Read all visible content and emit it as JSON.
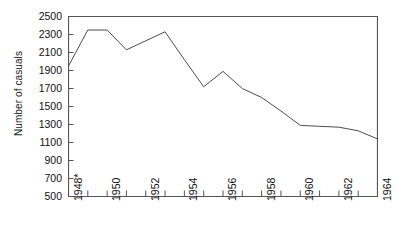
{
  "chart_data": {
    "type": "line",
    "title": "",
    "xlabel": "",
    "ylabel": "Number of casuals",
    "x": [
      1948,
      1949,
      1950,
      1951,
      1952,
      1953,
      1954,
      1955,
      1956,
      1957,
      1958,
      1959,
      1960,
      1961,
      1962,
      1963,
      1964
    ],
    "values": [
      1950,
      2350,
      2350,
      2130,
      2230,
      2330,
      2020,
      1720,
      1890,
      1700,
      1600,
      1450,
      1290,
      1280,
      1270,
      1230,
      1140
    ],
    "xlim": [
      1948,
      1964
    ],
    "ylim": [
      500,
      2500
    ],
    "y_ticks": [
      500,
      700,
      900,
      1100,
      1300,
      1500,
      1700,
      1900,
      2100,
      2300,
      2500
    ],
    "y_tick_labels": [
      "500",
      "700",
      "900",
      "1100",
      "1300",
      "1500",
      "1700",
      "1900",
      "2100",
      "2300",
      "2500"
    ],
    "x_ticks": [
      1948,
      1949,
      1950,
      1951,
      1952,
      1953,
      1954,
      1955,
      1956,
      1957,
      1958,
      1959,
      1960,
      1961,
      1962,
      1963,
      1964
    ],
    "x_tick_labels": [
      "1948*",
      "",
      "1950",
      "",
      "1952",
      "",
      "1954",
      "",
      "1956",
      "",
      "1958",
      "",
      "1960",
      "",
      "1962",
      "",
      "1964"
    ],
    "grid": false,
    "legend": null,
    "line_color": "#4d4d4d",
    "axis_color": "#4d4d4d",
    "background": "#ffffff"
  },
  "axes": {
    "y_title": "Number of casuals"
  }
}
